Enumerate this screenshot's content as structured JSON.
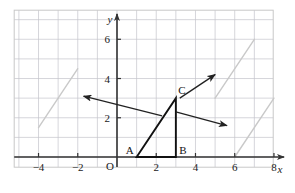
{
  "figure": {
    "background": "#ffffff",
    "border_color": "#c8c8c8",
    "grid_color": "#c4c4cc",
    "axis_color": "#333333",
    "shape_color": "#111111",
    "ghost_color": "#c9c9c9",
    "arrow_color": "#222222"
  },
  "axes": {
    "x_label": "x",
    "y_label": "y",
    "origin_label": "O",
    "x_ticks": [
      "-4",
      "-2",
      "2",
      "4",
      "6",
      "8"
    ],
    "x_tick_values": [
      -4,
      -2,
      2,
      4,
      6,
      8
    ],
    "y_ticks": [
      "2",
      "4",
      "6"
    ],
    "y_tick_values": [
      2,
      4,
      6
    ],
    "x_range": [
      -5,
      9
    ],
    "y_range": [
      -1,
      8
    ],
    "grid_step": 1
  },
  "chart_data": {
    "type": "scatter",
    "xlabel": "x",
    "ylabel": "y",
    "xlim": [
      -5,
      9
    ],
    "ylim": [
      -1,
      8
    ],
    "grid": true,
    "legend": "none",
    "shapes": [
      {
        "name": "triangle-ABC",
        "style": "solid-dark",
        "vertices": [
          {
            "label": "A",
            "x": 1,
            "y": 0
          },
          {
            "label": "B",
            "x": 3,
            "y": 0
          },
          {
            "label": "C",
            "x": 3,
            "y": 3
          }
        ]
      },
      {
        "name": "ghost-left",
        "style": "light-gray-hypotenuse",
        "vertices": [
          {
            "label": "",
            "x": -4,
            "y": 1.5
          },
          {
            "label": "",
            "x": -2,
            "y": 4.5
          }
        ]
      },
      {
        "name": "ghost-upper-right",
        "style": "light-gray-hypotenuse",
        "vertices": [
          {
            "label": "",
            "x": 5,
            "y": 3
          },
          {
            "label": "",
            "x": 7,
            "y": 6
          }
        ]
      },
      {
        "name": "ghost-lower-right",
        "style": "light-gray-hypotenuse",
        "vertices": [
          {
            "label": "",
            "x": 6,
            "y": 0
          },
          {
            "label": "",
            "x": 8,
            "y": 3
          }
        ]
      }
    ],
    "arrows": [
      {
        "name": "arrow-left",
        "from": {
          "x": 2.3,
          "y": 2.1
        },
        "to": {
          "x": -1.7,
          "y": 3.1
        }
      },
      {
        "name": "arrow-upper-right",
        "from": {
          "x": 3.2,
          "y": 3.0
        },
        "to": {
          "x": 5.0,
          "y": 4.2
        }
      },
      {
        "name": "arrow-right",
        "from": {
          "x": 3.0,
          "y": 2.3
        },
        "to": {
          "x": 5.6,
          "y": 1.6
        }
      }
    ]
  }
}
